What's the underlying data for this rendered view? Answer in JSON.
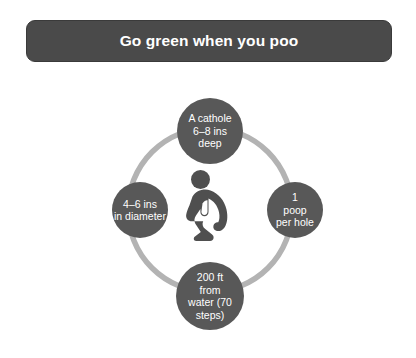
{
  "banner": {
    "title": "Go green when you poo"
  },
  "diagram": {
    "center_icon_name": "squatting-person-icon",
    "ring_color": "#b3b3b3",
    "node_color": "#585858",
    "banner_color": "#4a4a4a",
    "text_color": "#ffffff",
    "background_color": "#ffffff",
    "nodes": [
      {
        "position": "top",
        "label": "A cathole\n6–8 ins\ndeep"
      },
      {
        "position": "right",
        "label": "1\npoop\nper hole"
      },
      {
        "position": "bottom",
        "label": "200 ft\nfrom\nwater (70\nsteps)"
      },
      {
        "position": "left",
        "label": "4–6 ins\nin diameter"
      }
    ]
  }
}
